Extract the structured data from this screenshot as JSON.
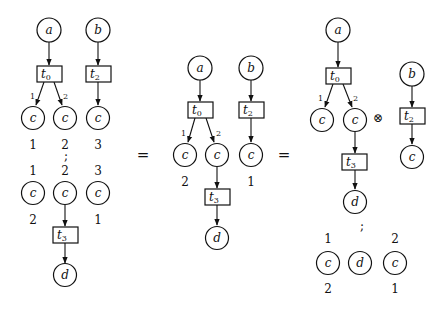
{
  "figure": {
    "operators": {
      "equals_1": "=",
      "equals_2": "=",
      "tensor": "⊗",
      "seq_1": ";",
      "seq_2": ";",
      "seq_3": ";"
    },
    "left": {
      "top_net": {
        "places": {
          "a": "a",
          "b": "b",
          "c1": "c",
          "c2": "c",
          "c3": "c"
        },
        "transitions": {
          "t0": "t",
          "t0_sub": "0",
          "t2": "t",
          "t2_sub": "2"
        },
        "arc_labels": {
          "out1": "1",
          "out2": "2"
        },
        "output_ports": [
          "1",
          "2",
          "3"
        ]
      },
      "bottom_net": {
        "input_ports": [
          "1",
          "2",
          "3"
        ],
        "places": {
          "c1": "c",
          "c2": "c",
          "c3": "c",
          "d": "d"
        },
        "transitions": {
          "t3": "t",
          "t3_sub": "3"
        },
        "output_ports": {
          "c1": "2",
          "c3": "1"
        }
      }
    },
    "middle": {
      "places": {
        "a": "a",
        "b": "b",
        "c1": "c",
        "c2": "c",
        "c3": "c",
        "d": "d"
      },
      "transitions": {
        "t0": "t",
        "t0_sub": "0",
        "t2": "t",
        "t2_sub": "2",
        "t3": "t",
        "t3_sub": "3"
      },
      "arc_labels": {
        "out1": "1",
        "out2": "2"
      },
      "output_ports": {
        "c1": "2",
        "c3": "1"
      }
    },
    "right": {
      "left_net": {
        "places": {
          "a": "a",
          "c1": "c",
          "c2": "c",
          "d": "d"
        },
        "transitions": {
          "t0": "t",
          "t0_sub": "0",
          "t3": "t",
          "t3_sub": "3"
        },
        "arc_labels": {
          "out1": "1",
          "out2": "2"
        }
      },
      "right_net": {
        "places": {
          "b": "b",
          "c": "c"
        },
        "transitions": {
          "t2": "t",
          "t2_sub": "2"
        }
      },
      "permutation": {
        "input_ports": [
          "1",
          "2"
        ],
        "places": {
          "c1": "c",
          "d": "d",
          "c2": "c"
        },
        "output_ports": [
          "2",
          "1"
        ]
      }
    }
  }
}
